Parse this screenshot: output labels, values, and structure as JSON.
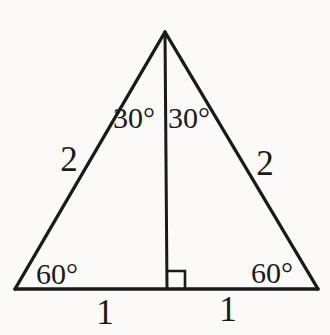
{
  "figure": {
    "labels": {
      "apex_angle_left": "30°",
      "apex_angle_right": "30°",
      "side_left": "2",
      "side_right": "2",
      "base_angle_left": "60°",
      "base_angle_right": "60°",
      "base_segment_left": "1",
      "base_segment_right": "1"
    }
  },
  "colors": {
    "background": "#fbfaf8",
    "line": "#1a1a1a"
  }
}
